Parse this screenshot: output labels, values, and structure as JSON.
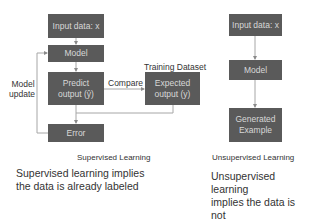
{
  "supervised": {
    "boxes": {
      "input": "Input data: x",
      "model": "Model",
      "predict_line1": "Predict",
      "predict_line2": "output (ŷ)",
      "expected_line1": "Expected",
      "expected_line2": "output (y)",
      "error": "Error"
    },
    "labels": {
      "training_dataset": "Training Dataset",
      "compare": "Compare",
      "model_update_line1": "Model",
      "model_update_line2": "update"
    },
    "caption": "Supervised Learning",
    "description_line1": "Supervised learning implies",
    "description_line2": "the data is already labeled"
  },
  "unsupervised": {
    "boxes": {
      "input": "Input data: x",
      "model": "Model",
      "generated_line1": "Generated",
      "generated_line2": "Example"
    },
    "caption": "Unsupervised Learning",
    "description_line1": "Unsupervised learning",
    "description_line2": "implies the data is not",
    "description_line3": "labeled"
  },
  "colors": {
    "box_fill": "#5a5a5a",
    "box_text": "#d8d8d8",
    "connector": "#a6a6a6"
  }
}
